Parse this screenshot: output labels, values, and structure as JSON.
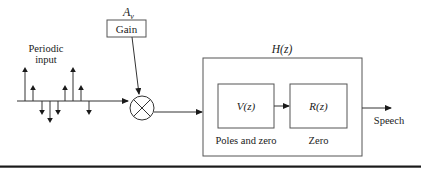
{
  "diagram": {
    "gain": {
      "symbol": "A",
      "subscript": "v",
      "label": "Gain"
    },
    "input": {
      "label_line1": "Periodic",
      "label_line2": "input"
    },
    "pulses": [
      {
        "x": 25,
        "dir": "up",
        "len": 34
      },
      {
        "x": 33,
        "dir": "up",
        "len": 16
      },
      {
        "x": 42,
        "dir": "down",
        "len": 14
      },
      {
        "x": 50,
        "dir": "down",
        "len": 22
      },
      {
        "x": 58,
        "dir": "down",
        "len": 14
      },
      {
        "x": 65,
        "dir": "up",
        "len": 16
      },
      {
        "x": 73,
        "dir": "up",
        "len": 34
      },
      {
        "x": 81,
        "dir": "up",
        "len": 16
      },
      {
        "x": 89,
        "dir": "down",
        "len": 14
      }
    ],
    "multiplier": {
      "symbol": "×"
    },
    "system": {
      "label": "H(z)"
    },
    "block_v": {
      "label": "V(z)",
      "caption": "Poles and zero"
    },
    "block_r": {
      "label": "R(z)",
      "caption": "Zero"
    },
    "output": {
      "label": "Speech"
    }
  }
}
